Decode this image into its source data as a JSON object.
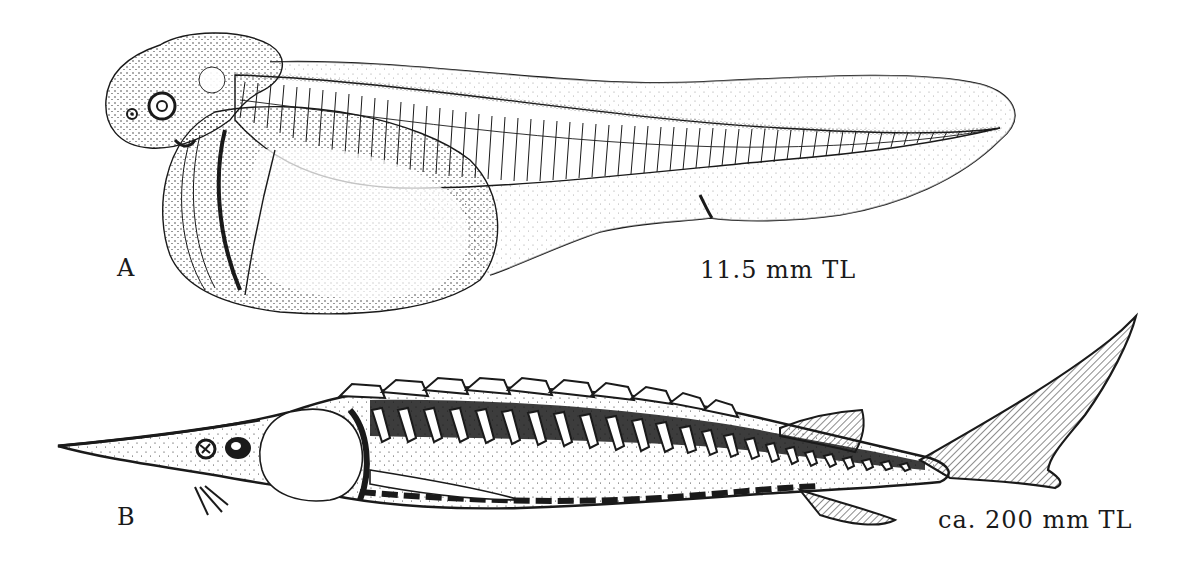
{
  "figure": {
    "panels": [
      {
        "id": "A",
        "label": "A",
        "size_label": "11.5 mm TL",
        "subject": "larva-with-yolk-sac"
      },
      {
        "id": "B",
        "label": "B",
        "size_label": "ca. 200 mm TL",
        "subject": "juvenile-sturgeon"
      }
    ],
    "colors": {
      "ink": "#1a1a1a",
      "paper": "#ffffff"
    }
  }
}
